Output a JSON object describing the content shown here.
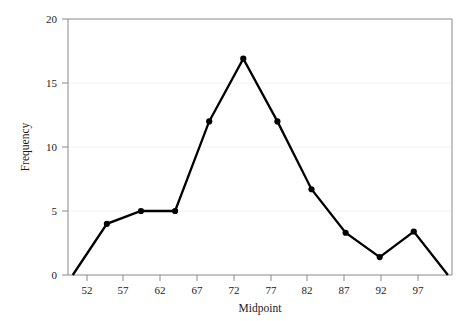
{
  "chart_data": {
    "type": "line",
    "title": "",
    "xlabel": "Midpoint",
    "ylabel": "Frequency",
    "x": [
      47,
      52,
      57,
      62,
      67,
      72,
      77,
      82,
      87,
      92,
      97,
      102
    ],
    "values": [
      0,
      4,
      5,
      5,
      12,
      16.9,
      12,
      6.7,
      3.3,
      1.4,
      3.4,
      0
    ],
    "marked_points_x": [
      52,
      57,
      62,
      67,
      72,
      77,
      82,
      87,
      92,
      97
    ],
    "xtick_labels": [
      "52",
      "57",
      "62",
      "67",
      "72",
      "77",
      "82",
      "87",
      "92",
      "97"
    ],
    "xtick_values": [
      52,
      57,
      62,
      67,
      72,
      77,
      82,
      87,
      92,
      97
    ],
    "ytick_labels": [
      "0",
      "5",
      "10",
      "15",
      "20"
    ],
    "ytick_values": [
      0,
      5,
      10,
      15,
      20
    ],
    "xlim": [
      46.3,
      102.6
    ],
    "ylim": [
      0,
      20
    ],
    "grid": true,
    "grid_axis": "y",
    "legend": "none",
    "line_color": "#000000",
    "marker_color": "#000000",
    "grid_color": "#f2f2f2",
    "axis_color": "#8a8a8a",
    "background_color": "#ffffff"
  },
  "labels": {
    "x_axis_title": "Midpoint",
    "y_axis_title": "Frequency",
    "y_20": "20",
    "y_15": "15",
    "y_10": "10",
    "y_5": "5",
    "y_0": "0",
    "x_52": "52",
    "x_57": "57",
    "x_62": "62",
    "x_67": "67",
    "x_72": "72",
    "x_77": "77",
    "x_82": "82",
    "x_87": "87",
    "x_92": "92",
    "x_97": "97"
  }
}
